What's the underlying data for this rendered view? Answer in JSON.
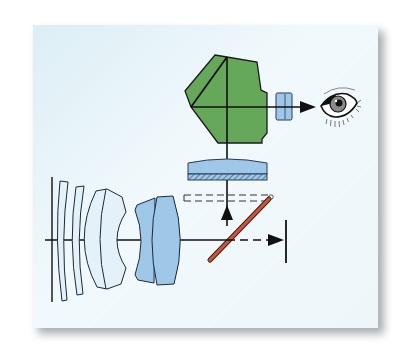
{
  "diagram": {
    "colors": {
      "background_panel": "#e8f4f9",
      "pentaprism": "#66a85a",
      "lens_light": "#e4f1f8",
      "lens_blue": "#9ec7e8",
      "mirror": "#c9553a",
      "stroke": "#1a1a1a"
    },
    "components": [
      {
        "id": "pentaprism",
        "label": "Pentaprism"
      },
      {
        "id": "eyepiece",
        "label": "Eyepiece"
      },
      {
        "id": "eye",
        "label": "Viewer eye"
      },
      {
        "id": "focusing-screen",
        "label": "Focusing screen / condenser"
      },
      {
        "id": "mirror",
        "label": "Reflex mirror"
      },
      {
        "id": "mirror-raised",
        "label": "Mirror raised position"
      },
      {
        "id": "lens-group",
        "label": "Objective lens elements"
      },
      {
        "id": "film-plane",
        "label": "Film / sensor plane"
      }
    ],
    "optical_axis": {
      "y": 240,
      "x_start": 45,
      "x_end": 287
    }
  }
}
